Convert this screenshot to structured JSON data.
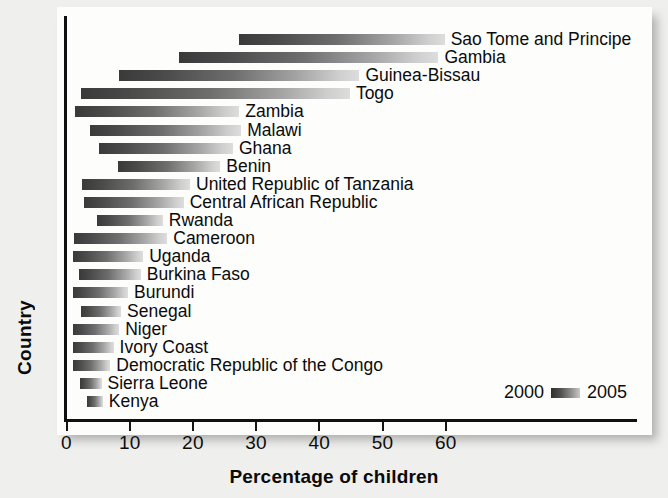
{
  "chart_data": {
    "type": "bar",
    "subtype": "range-bar",
    "title": "",
    "xlabel": "Percentage of children",
    "ylabel": "Country",
    "xlim": [
      0,
      68
    ],
    "xticks": [
      0,
      10,
      20,
      30,
      40,
      50,
      60
    ],
    "xticklabels": [
      "0",
      "10",
      "20",
      "30",
      "40",
      "50",
      "60"
    ],
    "grid": false,
    "legend": {
      "position": "bottom-right",
      "start_label": "2000",
      "end_label": "2005",
      "swatch": "gradient-dark-to-light"
    },
    "series": [
      {
        "name": "2000",
        "note": "dark end of each bar"
      },
      {
        "name": "2005",
        "note": "light end of each bar"
      }
    ],
    "categories": [
      "Sao Tome and Principe",
      "Gambia",
      "Guinea-Bissau",
      "Togo",
      "Zambia",
      "Malawi",
      "Ghana",
      "Benin",
      "United Republic of Tanzania",
      "Central African Republic",
      "Rwanda",
      "Cameroon",
      "Uganda",
      "Burkina Faso",
      "Burundi",
      "Senegal",
      "Niger",
      "Ivory Coast",
      "Democratic Republic of the Congo",
      "Sierra Leone",
      "Kenya"
    ],
    "bars": [
      {
        "label": "Sao Tome and Principe",
        "start": 27.5,
        "end": 60.0
      },
      {
        "label": "Gambia",
        "start": 18.0,
        "end": 59.0
      },
      {
        "label": "Guinea-Bissau",
        "start": 8.5,
        "end": 46.5
      },
      {
        "label": "Togo",
        "start": 2.5,
        "end": 45.0
      },
      {
        "label": "Zambia",
        "start": 1.5,
        "end": 27.5
      },
      {
        "label": "Malawi",
        "start": 3.9,
        "end": 27.8
      },
      {
        "label": "Ghana",
        "start": 5.3,
        "end": 26.5
      },
      {
        "label": "Benin",
        "start": 8.3,
        "end": 24.5
      },
      {
        "label": "United Republic of Tanzania",
        "start": 2.6,
        "end": 19.7
      },
      {
        "label": "Central African Republic",
        "start": 2.9,
        "end": 18.7
      },
      {
        "label": "Rwanda",
        "start": 5.0,
        "end": 15.4
      },
      {
        "label": "Cameroon",
        "start": 1.4,
        "end": 16.1
      },
      {
        "label": "Uganda",
        "start": 1.2,
        "end": 12.3
      },
      {
        "label": "Burkina Faso",
        "start": 2.1,
        "end": 11.9
      },
      {
        "label": "Burundi",
        "start": 1.2,
        "end": 9.9
      },
      {
        "label": "Senegal",
        "start": 2.5,
        "end": 8.8
      },
      {
        "label": "Niger",
        "start": 1.2,
        "end": 8.5
      },
      {
        "label": "Ivory Coast",
        "start": 1.2,
        "end": 7.6
      },
      {
        "label": "Democratic Republic of the Congo",
        "start": 1.2,
        "end": 7.1
      },
      {
        "label": "Sierra Leone",
        "start": 2.3,
        "end": 5.7
      },
      {
        "label": "Kenya",
        "start": 3.4,
        "end": 5.9
      }
    ]
  },
  "axes": {
    "x_title": "Percentage of children",
    "y_title": "Country"
  }
}
